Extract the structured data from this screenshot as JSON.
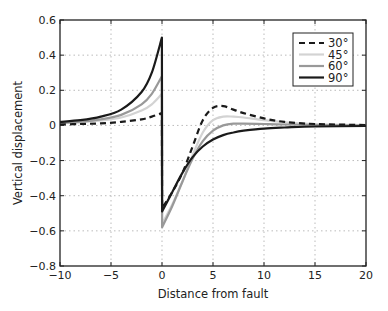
{
  "chart_data": {
    "type": "line",
    "title": "",
    "xlabel": "Distance from fault",
    "ylabel": "Vertical displacement",
    "xlim": [
      -10,
      20
    ],
    "ylim": [
      -0.8,
      0.6
    ],
    "xticks": [
      -10,
      -5,
      0,
      5,
      10,
      15,
      20
    ],
    "yticks": [
      -0.8,
      -0.6,
      -0.4,
      -0.2,
      0,
      0.2,
      0.4,
      0.6
    ],
    "xtick_labels": [
      "−10",
      "−5",
      "0",
      "5",
      "10",
      "15",
      "20"
    ],
    "ytick_labels": [
      "−0.8",
      "−0.6",
      "−0.4",
      "−0.2",
      "0",
      "0.2",
      "0.4",
      "0.6"
    ],
    "grid": true,
    "legend_position": "upper right",
    "series": [
      {
        "name": "30°",
        "color": "#1a1a1a",
        "dash": "6,4",
        "width": 2.2,
        "x": [
          -10,
          -8,
          -6,
          -4,
          -2,
          -1,
          -0.01,
          0.01,
          1,
          2,
          3,
          4,
          5,
          6,
          7,
          8,
          10,
          12,
          15,
          20
        ],
        "values": [
          0.005,
          0.008,
          0.012,
          0.02,
          0.035,
          0.05,
          0.07,
          -0.47,
          -0.38,
          -0.27,
          -0.12,
          0.03,
          0.1,
          0.11,
          0.09,
          0.07,
          0.04,
          0.02,
          0.008,
          0.002
        ]
      },
      {
        "name": "45°",
        "color": "#d3d3d3",
        "dash": "",
        "width": 2.2,
        "x": [
          -10,
          -8,
          -6,
          -4,
          -2,
          -1,
          -0.01,
          0.01,
          1,
          2,
          3,
          4,
          5,
          6,
          7,
          8,
          10,
          12,
          15,
          20
        ],
        "values": [
          0.012,
          0.018,
          0.028,
          0.045,
          0.085,
          0.12,
          0.18,
          -0.56,
          -0.45,
          -0.32,
          -0.17,
          -0.04,
          0.03,
          0.05,
          0.05,
          0.045,
          0.03,
          0.018,
          0.008,
          0.002
        ]
      },
      {
        "name": "60°",
        "color": "#999999",
        "dash": "",
        "width": 2.2,
        "x": [
          -10,
          -8,
          -6,
          -4,
          -2,
          -1,
          -0.01,
          0.01,
          1,
          2,
          3,
          4,
          5,
          6,
          7,
          8,
          10,
          12,
          15,
          20
        ],
        "values": [
          0.015,
          0.022,
          0.035,
          0.06,
          0.12,
          0.18,
          0.28,
          -0.58,
          -0.46,
          -0.32,
          -0.19,
          -0.09,
          -0.03,
          0.0,
          0.01,
          0.01,
          0.008,
          0.005,
          0.002,
          0.0
        ]
      },
      {
        "name": "90°",
        "color": "#1a1a1a",
        "dash": "",
        "width": 2.2,
        "x": [
          -10,
          -8,
          -6,
          -4,
          -2,
          -1,
          -0.01,
          0.01,
          1,
          2,
          3,
          4,
          5,
          6,
          7,
          8,
          10,
          12,
          15,
          20
        ],
        "values": [
          0.02,
          0.03,
          0.05,
          0.09,
          0.19,
          0.3,
          0.5,
          -0.49,
          -0.38,
          -0.27,
          -0.18,
          -0.12,
          -0.08,
          -0.055,
          -0.04,
          -0.03,
          -0.018,
          -0.012,
          -0.006,
          -0.003
        ]
      }
    ]
  }
}
